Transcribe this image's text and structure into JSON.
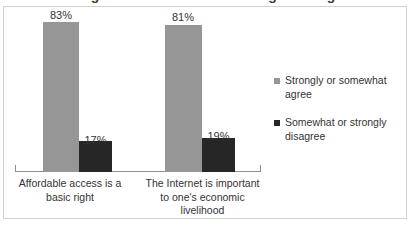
{
  "chart_data": {
    "type": "bar",
    "title": "Rights and Goods for Making a Living",
    "categories": [
      "Affordable access is a basic right",
      "The Internet is important to one's economic livelihood"
    ],
    "series": [
      {
        "name": "Strongly or somewhat agree",
        "color": "#969696",
        "values": [
          83,
          81
        ],
        "labels": [
          "83%",
          "19%"
        ]
      },
      {
        "name": "Somewhat or strongly disagree",
        "color": "#262626",
        "values": [
          17,
          19
        ],
        "labels": [
          "17%",
          "19%"
        ]
      }
    ],
    "value_labels": {
      "group1_agree": "83%",
      "group1_disagree": "17%",
      "group2_agree": "81%",
      "group2_disagree": "19%"
    },
    "xlabel": "",
    "ylabel": "",
    "ylim": [
      0,
      100
    ],
    "grid": false,
    "legend_position": "right",
    "units": "percent"
  },
  "categories": {
    "group1": {
      "line1": "Affordable access is a",
      "line2": "basic right"
    },
    "group2": {
      "line1": "The Internet is important",
      "line2": "to one's economic",
      "line3": "livelihood"
    }
  },
  "legend": {
    "entries": [
      {
        "label": "Strongly or somewhat agree",
        "color": "#969696"
      },
      {
        "label": "Somewhat or strongly disagree",
        "color": "#262626"
      }
    ]
  }
}
